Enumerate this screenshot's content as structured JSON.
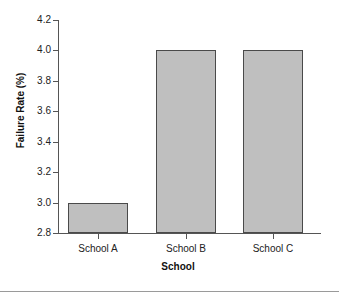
{
  "chart_data": {
    "type": "bar",
    "title": "",
    "categories": [
      "School A",
      "School B",
      "School C"
    ],
    "values": [
      3.0,
      4.0,
      4.0
    ],
    "xlabel": "School",
    "ylabel": "Failure Rate (%)",
    "ylim": [
      2.8,
      4.2
    ],
    "ytick_labels": [
      "2.8",
      "3.0",
      "3.2",
      "3.4",
      "3.6",
      "3.8",
      "4.0",
      "4.2"
    ],
    "ytick_values": [
      2.8,
      3.0,
      3.2,
      3.4,
      3.6,
      3.8,
      4.0,
      4.2
    ],
    "ytick_step": 0.2,
    "grid": false,
    "legend": null,
    "legend_position": "none",
    "bar_fill_color": "#bfbfbf",
    "bar_edge_color": "#4a4a4a",
    "axis_color": "#555555",
    "background_color": "#ffffff",
    "annotations": []
  },
  "axes": {
    "y_title": "Failure Rate (%)",
    "x_title": "School"
  },
  "ticks": {
    "y": [
      {
        "label": "4.2",
        "value": 4.2
      },
      {
        "label": "4.0",
        "value": 4.0
      },
      {
        "label": "3.8",
        "value": 3.8
      },
      {
        "label": "3.6",
        "value": 3.6
      },
      {
        "label": "3.4",
        "value": 3.4
      },
      {
        "label": "3.2",
        "value": 3.2
      },
      {
        "label": "3.0",
        "value": 3.0
      },
      {
        "label": "2.8",
        "value": 2.8
      }
    ]
  },
  "bars": [
    {
      "label": "School A",
      "value": 3.0
    },
    {
      "label": "School B",
      "value": 4.0
    },
    {
      "label": "School C",
      "value": 4.0
    }
  ]
}
